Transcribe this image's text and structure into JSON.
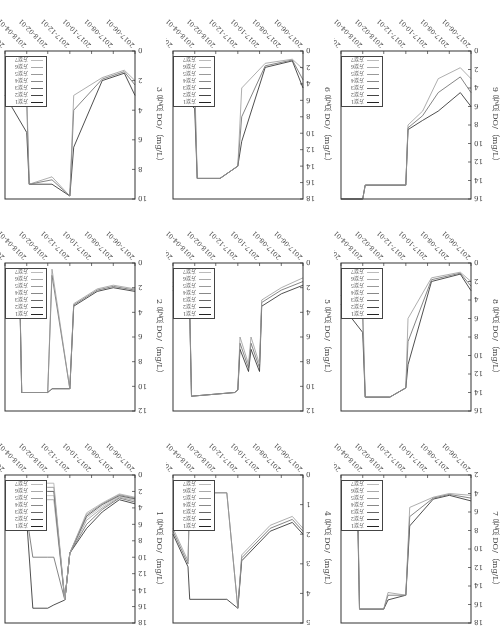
{
  "chart_data": [
    {
      "type": "line",
      "panel": 1,
      "title": "",
      "ylabel": "1 号点 DO/（mg/L）",
      "xlabel": "",
      "ylim": [
        0,
        18
      ],
      "yticks": [
        0,
        2,
        4,
        6,
        8,
        10,
        12,
        14,
        16,
        18
      ],
      "xticks": [
        "2017-06-01",
        "2017-08-01",
        "2017-10-01",
        "2017-12-01",
        "2018-02-01",
        "2018-04-01",
        "2018-06-01"
      ],
      "legend": [
        "方案1",
        "方案2",
        "方案3",
        "方案4",
        "方案5",
        "方案6",
        "方案7"
      ],
      "x": [
        "2017-06-01",
        "2017-07-15",
        "2017-09-01",
        "2017-10-15",
        "2017-12-01",
        "2017-12-15",
        "2018-01-15",
        "2018-02-01",
        "2018-03-15",
        "2018-04-01",
        "2018-04-20",
        "2018-06-01"
      ],
      "series": [
        {
          "name": "方案1",
          "values": [
            3.5,
            3.0,
            4.5,
            6.5,
            9.5,
            15.2,
            15.8,
            16.2,
            16.2,
            5.5,
            4.5,
            3.5
          ]
        },
        {
          "name": "方案2",
          "values": [
            3.3,
            2.8,
            4.2,
            6.0,
            9.5,
            15.2,
            10,
            10,
            10,
            5.0,
            4.2,
            3.2
          ]
        },
        {
          "name": "方案3",
          "values": [
            3.1,
            2.7,
            4.0,
            5.5,
            9.5,
            15.2,
            3.0,
            3.0,
            3.0,
            4.6,
            3.8,
            3.0
          ]
        },
        {
          "name": "方案4",
          "values": [
            3.0,
            2.6,
            3.8,
            5.2,
            9.5,
            15.2,
            2.5,
            2.5,
            2.5,
            4.3,
            3.5,
            2.8
          ]
        },
        {
          "name": "方案5",
          "values": [
            2.9,
            2.5,
            3.6,
            5.0,
            9.5,
            15.2,
            2.0,
            2.0,
            2.0,
            4.0,
            3.3,
            2.6
          ]
        },
        {
          "name": "方案6",
          "values": [
            2.8,
            2.4,
            3.5,
            4.8,
            9.5,
            15.2,
            1.5,
            1.5,
            1.5,
            3.8,
            3.1,
            2.5
          ]
        },
        {
          "name": "方案7",
          "values": [
            2.7,
            2.3,
            3.4,
            4.6,
            9.5,
            15.2,
            1.0,
            1.0,
            1.0,
            3.6,
            3.0,
            2.4
          ]
        }
      ]
    },
    {
      "type": "line",
      "panel": 2,
      "ylabel": "2 号点 DO/（mg/L）",
      "ylim": [
        0,
        12
      ],
      "yticks": [
        0,
        2,
        4,
        6,
        8,
        10,
        12
      ],
      "xticks": [
        "2017-06-01",
        "2017-08-01",
        "2017-10-01",
        "2017-12-01",
        "2018-02-01",
        "2018-04-01",
        "2018-06-01"
      ],
      "legend": [
        "方案1",
        "方案2",
        "方案3",
        "方案4",
        "方案5",
        "方案6",
        "方案7"
      ],
      "x": [
        "2017-06-01",
        "2017-08-01",
        "2017-09-15",
        "2017-11-20",
        "2017-12-01",
        "2018-01-20",
        "2018-02-01",
        "2018-04-15",
        "2018-04-20",
        "2018-06-01"
      ],
      "series": [
        {
          "name": "方案1",
          "values": [
            2.3,
            2.0,
            2.3,
            3.5,
            10.2,
            10.2,
            10.5,
            10.5,
            3.5,
            2.5
          ]
        },
        {
          "name": "方案4",
          "values": [
            2.2,
            1.9,
            2.2,
            3.4,
            10.2,
            1.0,
            10.5,
            10.5,
            3.3,
            2.3
          ]
        },
        {
          "name": "方案7",
          "values": [
            2.1,
            1.8,
            2.1,
            3.3,
            10.2,
            0.5,
            10.5,
            10.5,
            3.1,
            2.1
          ]
        }
      ]
    },
    {
      "type": "line",
      "panel": 3,
      "ylabel": "3 号点 DO/（mg/L）",
      "ylim": [
        0,
        10
      ],
      "yticks": [
        0,
        2,
        4,
        6,
        8,
        10
      ],
      "xticks": [
        "2017-06-01",
        "2017-08-01",
        "2017-10-01",
        "2017-12-01",
        "2018-02-01",
        "2018-04-01",
        "2018-06-01"
      ],
      "legend": [
        "方案1",
        "方案2",
        "方案3",
        "方案4",
        "方案5",
        "方案6",
        "方案7"
      ],
      "x": [
        "2017-06-01",
        "2017-07-01",
        "2017-09-01",
        "2017-11-20",
        "2017-12-01",
        "2018-01-20",
        "2018-03-25",
        "2018-04-01",
        "2018-06-01"
      ],
      "series": [
        {
          "name": "方案1",
          "values": [
            3.0,
            1.5,
            2.0,
            6.5,
            9.8,
            9.0,
            9.0,
            5.5,
            3.0
          ]
        },
        {
          "name": "方案4",
          "values": [
            2.3,
            1.4,
            1.9,
            4.0,
            9.8,
            8.7,
            9.0,
            3.5,
            2.2
          ]
        },
        {
          "name": "方案7",
          "values": [
            2.0,
            1.3,
            1.8,
            3.0,
            9.8,
            8.5,
            9.0,
            2.7,
            1.9
          ]
        }
      ]
    },
    {
      "type": "line",
      "panel": 4,
      "ylabel": "4 号点 DO/（mg/L）",
      "ylim": [
        0,
        5
      ],
      "yticks": [
        0,
        1,
        2,
        3,
        4,
        5
      ],
      "xticks": [
        "2017-06-01",
        "2017-08-01",
        "2017-10-01",
        "2017-12-01",
        "2018-02-01",
        "2018-04-01",
        "2018-06-01"
      ],
      "legend": [
        "方案1",
        "方案2",
        "方案3",
        "方案4",
        "方案5",
        "方案6",
        "方案7"
      ],
      "x": [
        "2017-06-01",
        "2017-07-01",
        "2017-09-01",
        "2017-11-20",
        "2017-12-01",
        "2018-01-01",
        "2018-04-15",
        "2018-04-20",
        "2018-06-01"
      ],
      "series": [
        {
          "name": "方案1",
          "values": [
            2.0,
            1.6,
            1.9,
            2.9,
            4.5,
            4.2,
            4.2,
            3.1,
            2.0
          ]
        },
        {
          "name": "方案4",
          "values": [
            1.9,
            1.5,
            1.8,
            2.8,
            4.5,
            0.6,
            0.6,
            3.0,
            1.9
          ]
        },
        {
          "name": "方案7",
          "values": [
            1.8,
            1.4,
            1.7,
            2.7,
            4.5,
            0.6,
            0.6,
            2.9,
            1.8
          ]
        }
      ]
    },
    {
      "type": "line",
      "panel": 5,
      "ylabel": "5 号点 DO/（mg/L）",
      "ylim": [
        0,
        12
      ],
      "yticks": [
        0,
        2,
        4,
        6,
        8,
        10,
        12
      ],
      "xticks": [
        "2017-06-01",
        "2017-08-01",
        "2017-10-01",
        "2017-12-01",
        "2018-02-01",
        "2018-04-01",
        "2018-06-01"
      ],
      "legend": [
        "方案1",
        "方案2",
        "方案3",
        "方案4",
        "方案5",
        "方案6",
        "方案7"
      ],
      "x": [
        "2017-06-01",
        "2017-08-01",
        "2017-09-25",
        "2017-10-01",
        "2017-10-25",
        "2017-11-01",
        "2017-11-25",
        "2017-12-01",
        "2017-12-10",
        "2018-04-10",
        "2018-04-15",
        "2018-06-01"
      ],
      "series": [
        {
          "name": "方案1",
          "values": [
            1.8,
            2.5,
            3.5,
            8.8,
            7.0,
            8.8,
            7.0,
            10.3,
            10.5,
            10.8,
            4.0,
            2.2
          ]
        },
        {
          "name": "方案4",
          "values": [
            1.5,
            2.2,
            3.2,
            8.5,
            6.5,
            8.5,
            6.5,
            10.3,
            10.5,
            10.8,
            3.7,
            1.9
          ]
        },
        {
          "name": "方案7",
          "values": [
            1.2,
            2.0,
            3.0,
            8.2,
            6.0,
            8.2,
            6.0,
            10.3,
            10.5,
            10.8,
            3.4,
            1.6
          ]
        }
      ]
    },
    {
      "type": "line",
      "panel": 6,
      "ylabel": "6 号点 DO/（mg/L）",
      "ylim": [
        0,
        18
      ],
      "yticks": [
        0,
        2,
        4,
        6,
        8,
        10,
        12,
        14,
        16,
        18
      ],
      "xticks": [
        "2017-06-01",
        "2017-08-01",
        "2017-10-01",
        "2017-12-01",
        "2018-02-01",
        "2018-04-01",
        "2018-06-01"
      ],
      "legend": [
        "方案1",
        "方案2",
        "方案3",
        "方案4",
        "方案5",
        "方案6",
        "方案7"
      ],
      "x": [
        "2017-06-01",
        "2017-07-01",
        "2017-09-15",
        "2017-11-20",
        "2017-12-01",
        "2018-01-20",
        "2018-03-25",
        "2018-04-01",
        "2018-06-01"
      ],
      "series": [
        {
          "name": "方案1",
          "values": [
            4.5,
            1.2,
            2.0,
            11.0,
            14.0,
            15.5,
            15.5,
            7.0,
            4.5
          ]
        },
        {
          "name": "方案4",
          "values": [
            3.5,
            1.1,
            1.8,
            8.0,
            14.0,
            15.5,
            15.5,
            5.0,
            3.0
          ]
        },
        {
          "name": "方案7",
          "values": [
            2.2,
            1.0,
            1.5,
            4.5,
            14.0,
            15.5,
            15.5,
            3.5,
            1.8
          ]
        }
      ]
    },
    {
      "type": "line",
      "panel": 7,
      "ylabel": "7 号点 DO/（mg/L）",
      "ylim": [
        2,
        18
      ],
      "yticks": [
        2,
        4,
        6,
        8,
        10,
        12,
        14,
        16,
        18
      ],
      "xticks": [
        "2017-06-01",
        "2017-08-01",
        "2017-10-01",
        "2017-12-01",
        "2018-02-01",
        "2018-04-01",
        "2018-06-01"
      ],
      "legend": [
        "方案1",
        "方案2",
        "方案3",
        "方案4",
        "方案5",
        "方案6",
        "方案7"
      ],
      "x": [
        "2017-06-01",
        "2017-08-01",
        "2017-09-15",
        "2017-11-20",
        "2017-12-01",
        "2018-01-20",
        "2018-02-01",
        "2018-04-10",
        "2018-04-15",
        "2018-06-01"
      ],
      "series": [
        {
          "name": "方案1",
          "values": [
            4.8,
            4.2,
            4.6,
            7.5,
            15.0,
            15.5,
            16.5,
            16.5,
            6.5,
            4.8
          ]
        },
        {
          "name": "方案4",
          "values": [
            4.5,
            4.1,
            4.5,
            6.5,
            15.0,
            15.0,
            16.5,
            16.5,
            5.5,
            4.4
          ]
        },
        {
          "name": "方案7",
          "values": [
            4.2,
            4.0,
            4.4,
            5.5,
            15.0,
            14.7,
            16.5,
            16.5,
            4.8,
            4.0
          ]
        }
      ]
    },
    {
      "type": "line",
      "panel": 8,
      "ylabel": "8 号点 DO/（mg/L）",
      "ylim": [
        0,
        16
      ],
      "yticks": [
        0,
        2,
        4,
        6,
        8,
        10,
        12,
        14,
        16
      ],
      "xticks": [
        "2017-06-01",
        "2017-08-01",
        "2017-10-01",
        "2017-12-01",
        "2018-02-01",
        "2018-04-01",
        "2018-06-01"
      ],
      "legend": [
        "方案1",
        "方案2",
        "方案3",
        "方案4",
        "方案5",
        "方案6",
        "方案7"
      ],
      "x": [
        "2017-06-01",
        "2017-07-01",
        "2017-09-20",
        "2017-11-25",
        "2017-12-01",
        "2018-01-15",
        "2018-03-25",
        "2018-04-01",
        "2018-06-01"
      ],
      "series": [
        {
          "name": "方案1",
          "values": [
            3.0,
            1.2,
            2.0,
            11.0,
            13.5,
            14.5,
            14.5,
            7.5,
            4.5
          ]
        },
        {
          "name": "方案4",
          "values": [
            2.5,
            1.1,
            1.8,
            8.5,
            13.5,
            14.5,
            14.5,
            6.0,
            3.5
          ]
        },
        {
          "name": "方案7",
          "values": [
            2.0,
            1.0,
            1.6,
            6.0,
            13.5,
            14.5,
            14.5,
            4.5,
            2.5
          ]
        }
      ]
    },
    {
      "type": "line",
      "panel": 9,
      "ylabel": "9 号点 DO/（mg/L）",
      "ylim": [
        0,
        16
      ],
      "yticks": [
        0,
        2,
        4,
        6,
        8,
        10,
        12,
        14,
        16
      ],
      "xticks": [
        "2017-06-01",
        "2017-08-01",
        "2017-10-01",
        "2017-12-01",
        "2018-02-01",
        "2018-04-01",
        "2018-06-01"
      ],
      "legend": [
        "方案1",
        "方案2",
        "方案3",
        "方案4",
        "方案5",
        "方案6",
        "方案7"
      ],
      "x": [
        "2017-06-01",
        "2017-07-01",
        "2017-09-01",
        "2017-10-15",
        "2017-11-25",
        "2017-12-01",
        "2018-03-25",
        "2018-04-01",
        "2018-06-01"
      ],
      "series": [
        {
          "name": "方案1",
          "values": [
            6.0,
            4.5,
            6.5,
            7.5,
            8.5,
            14.5,
            14.5,
            16.0,
            16.0
          ]
        },
        {
          "name": "方案4",
          "values": [
            4.5,
            2.8,
            4.5,
            7.0,
            8.3,
            14.5,
            14.5,
            16.0,
            16.0
          ]
        },
        {
          "name": "方案7",
          "values": [
            3.0,
            1.8,
            3.0,
            6.5,
            8.0,
            14.5,
            14.5,
            16.0,
            16.0
          ]
        }
      ]
    }
  ],
  "page": {
    "orientation": "rotated 180°"
  }
}
